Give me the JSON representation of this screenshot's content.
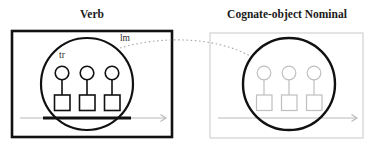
{
  "figure": {
    "caption_left": "Verb",
    "caption_right": "Cognate-object Nominal",
    "colors": {
      "profiled": "#111111",
      "backgrounded": "#b9b9b9",
      "panel_border_left": "#111111",
      "panel_border_right": "#c9c9c9",
      "correspondence": "#a9a9a9",
      "background": "#ffffff"
    }
  },
  "panels": [
    {
      "id": "verb-panel",
      "title": "Verb",
      "title_x": 92,
      "title_y": 18,
      "box": {
        "x": 12,
        "y": 31,
        "width": 160,
        "height": 106,
        "stroke_width": 2.6,
        "stroke": "#111111"
      },
      "profile_circle": {
        "cx": 87,
        "cy": 84,
        "r": 46,
        "stroke_width": 2.2,
        "stroke": "#111111"
      },
      "labels": [
        {
          "name": "tr",
          "text": "tr",
          "x": 62,
          "y": 58
        },
        {
          "name": "lm",
          "text": "lm",
          "x": 125,
          "y": 41
        }
      ],
      "participants": [
        {
          "circle": {
            "cx": 62,
            "cy": 73,
            "r": 6.8
          },
          "square": {
            "x": 54.5,
            "y": 95,
            "width": 15.5,
            "height": 15.5
          },
          "stem": {
            "x": 62,
            "y1": 79.8,
            "y2": 95
          }
        },
        {
          "circle": {
            "cx": 87,
            "cy": 73,
            "r": 6.8
          },
          "square": {
            "x": 79.5,
            "y": 95,
            "width": 15.5,
            "height": 15.5
          },
          "stem": {
            "x": 87,
            "y1": 79.8,
            "y2": 95
          }
        },
        {
          "circle": {
            "cx": 112,
            "cy": 73,
            "r": 6.8
          },
          "square": {
            "x": 104.5,
            "y": 95,
            "width": 15.5,
            "height": 15.5
          },
          "stem": {
            "x": 112,
            "y1": 79.8,
            "y2": 95
          }
        }
      ],
      "participant_stroke": "#111111",
      "participant_stroke_width": 1.6,
      "time_arrow": {
        "y": 118,
        "x1": 20,
        "x2": 166,
        "stroke": "#b9b9b9",
        "stroke_width": 1.1,
        "profiled_segment": {
          "x1": 43,
          "x2": 131,
          "stroke": "#111111",
          "stroke_width": 3
        },
        "arrowhead": {
          "x": 166,
          "y": 118,
          "stroke": "#b9b9b9"
        }
      }
    },
    {
      "id": "cognate-object-nominal-panel",
      "title": "Cognate-object Nominal",
      "title_x": 287,
      "title_y": 18,
      "box": {
        "x": 210,
        "y": 33,
        "width": 153,
        "height": 105,
        "stroke_width": 1,
        "stroke": "#c9c9c9"
      },
      "profile_circle": {
        "cx": 289,
        "cy": 84,
        "r": 46,
        "stroke_width": 2.4,
        "stroke": "#111111"
      },
      "labels": [],
      "participants": [
        {
          "circle": {
            "cx": 264,
            "cy": 73,
            "r": 6.8
          },
          "square": {
            "x": 256.5,
            "y": 95,
            "width": 15.5,
            "height": 15.5
          },
          "stem": {
            "x": 264,
            "y1": 79.8,
            "y2": 95
          }
        },
        {
          "circle": {
            "cx": 289,
            "cy": 73,
            "r": 6.8
          },
          "square": {
            "x": 281.5,
            "y": 95,
            "width": 15.5,
            "height": 15.5
          },
          "stem": {
            "x": 289,
            "y1": 79.8,
            "y2": 95
          }
        },
        {
          "circle": {
            "cx": 314,
            "cy": 73,
            "r": 6.8
          },
          "square": {
            "x": 306.5,
            "y": 95,
            "width": 15.5,
            "height": 15.5
          },
          "stem": {
            "x": 314,
            "y1": 79.8,
            "y2": 95
          }
        }
      ],
      "participant_stroke": "#bfbfbf",
      "participant_stroke_width": 1.2,
      "time_arrow": {
        "y": 118,
        "x1": 218,
        "x2": 357,
        "stroke": "#b9b9b9",
        "stroke_width": 1.1,
        "profiled_segment": null,
        "arrowhead": {
          "x": 357,
          "y": 118,
          "stroke": "#b9b9b9"
        }
      }
    }
  ],
  "correspondence_line": {
    "name": "correspondence-dotted-line",
    "path": "M 120 48 C 160 36, 215 36, 252 57",
    "stroke": "#a9a9a9",
    "stroke_width": 1.1,
    "dash": "1.6 2.6"
  }
}
